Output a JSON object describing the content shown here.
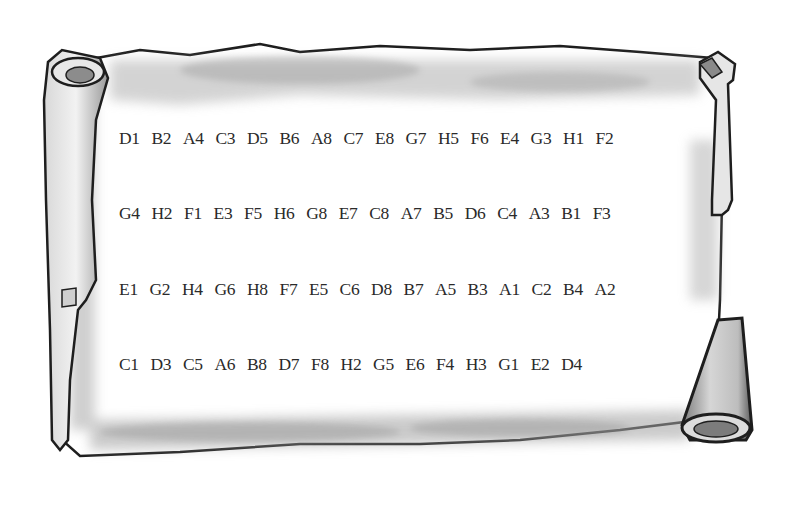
{
  "scroll": {
    "rows": [
      [
        "D1",
        "B2",
        "A4",
        "C3",
        "D5",
        "B6",
        "A8",
        "C7",
        "E8",
        "G7",
        "H5",
        "F6",
        "E4",
        "G3",
        "H1",
        "F2"
      ],
      [
        "G4",
        "H2",
        "F1",
        "E3",
        "F5",
        "H6",
        "G8",
        "E7",
        "C8",
        "A7",
        "B5",
        "D6",
        "C4",
        "A3",
        "B1",
        "F3"
      ],
      [
        "E1",
        "G2",
        "H4",
        "G6",
        "H8",
        "F7",
        "E5",
        "C6",
        "D8",
        "B7",
        "A5",
        "B3",
        "A1",
        "C2",
        "B4",
        "A2"
      ],
      [
        "C1",
        "D3",
        "C5",
        "A6",
        "B8",
        "D7",
        "F8",
        "H2",
        "G5",
        "E6",
        "F4",
        "H3",
        "G1",
        "E2",
        "D4"
      ]
    ]
  },
  "colors": {
    "ink": "#2a2a2a",
    "outline": "#1e1e1e",
    "parchment": "#ffffff",
    "shade": "#a8a8a8"
  }
}
